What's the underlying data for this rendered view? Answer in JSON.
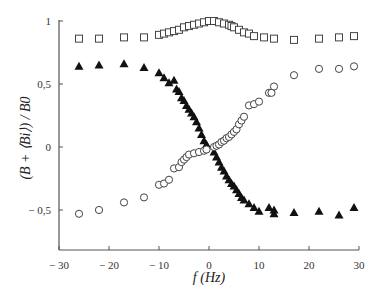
{
  "chart_data": {
    "type": "scatter",
    "title": "",
    "xlabel": "f (Hz)",
    "ylabel": "(B + ⟨Bi⟩) / B0",
    "xlim": [
      -30,
      30
    ],
    "ylim": [
      -0.82,
      1.0
    ],
    "xticks": [
      -30,
      -20,
      -10,
      0,
      10,
      20,
      30
    ],
    "xtick_labels": [
      "− 30",
      "− 20",
      "− 10",
      "0",
      "10",
      "20",
      "30"
    ],
    "yticks": [
      -0.5,
      0,
      0.5,
      1
    ],
    "ytick_labels": [
      "− 0,5",
      "0",
      "0,5",
      "1"
    ],
    "grid": false,
    "legend": null,
    "series": [
      {
        "name": "open squares",
        "marker": "square-open",
        "points": [
          [
            -26,
            0.86
          ],
          [
            -22,
            0.86
          ],
          [
            -17,
            0.87
          ],
          [
            -13,
            0.87
          ],
          [
            -10,
            0.89
          ],
          [
            -9,
            0.9
          ],
          [
            -8,
            0.91
          ],
          [
            -7,
            0.92
          ],
          [
            -6,
            0.93
          ],
          [
            -5,
            0.95
          ],
          [
            -4,
            0.96
          ],
          [
            -3,
            0.97
          ],
          [
            -2,
            0.98
          ],
          [
            -1,
            0.99
          ],
          [
            0,
            1.0
          ],
          [
            1,
            1.0
          ],
          [
            2,
            0.99
          ],
          [
            3,
            0.98
          ],
          [
            4,
            0.97
          ],
          [
            4.5,
            0.96
          ],
          [
            5,
            0.95
          ],
          [
            6,
            0.93
          ],
          [
            7,
            0.91
          ],
          [
            8,
            0.9
          ],
          [
            9,
            0.88
          ],
          [
            11,
            0.87
          ],
          [
            13,
            0.86
          ],
          [
            17,
            0.85
          ],
          [
            22,
            0.86
          ],
          [
            26,
            0.87
          ],
          [
            29,
            0.88
          ]
        ]
      },
      {
        "name": "filled triangles",
        "marker": "triangle-filled",
        "points": [
          [
            -26,
            0.64
          ],
          [
            -22,
            0.65
          ],
          [
            -17,
            0.66
          ],
          [
            -13,
            0.63
          ],
          [
            -10,
            0.59
          ],
          [
            -9,
            0.55
          ],
          [
            -8,
            0.51
          ],
          [
            -7,
            0.53
          ],
          [
            -6.5,
            0.46
          ],
          [
            -6,
            0.44
          ],
          [
            -5.5,
            0.39
          ],
          [
            -5,
            0.37
          ],
          [
            -4.5,
            0.33
          ],
          [
            -4,
            0.3
          ],
          [
            -3.5,
            0.27
          ],
          [
            -3,
            0.24
          ],
          [
            -2.5,
            0.2
          ],
          [
            -2,
            0.15
          ],
          [
            -1.5,
            0.1
          ],
          [
            -1,
            0.05
          ],
          [
            -0.5,
            0.02
          ],
          [
            1,
            -0.04
          ],
          [
            1.5,
            -0.08
          ],
          [
            2,
            -0.12
          ],
          [
            2.5,
            -0.16
          ],
          [
            3,
            -0.19
          ],
          [
            3.5,
            -0.23
          ],
          [
            4,
            -0.26
          ],
          [
            4.5,
            -0.29
          ],
          [
            5,
            -0.31
          ],
          [
            5.5,
            -0.34
          ],
          [
            6,
            -0.37
          ],
          [
            6.5,
            -0.4
          ],
          [
            7,
            -0.42
          ],
          [
            8,
            -0.45
          ],
          [
            9,
            -0.48
          ],
          [
            10,
            -0.51
          ],
          [
            12,
            -0.48
          ],
          [
            13,
            -0.5
          ],
          [
            13,
            -0.53
          ],
          [
            17,
            -0.52
          ],
          [
            22,
            -0.51
          ],
          [
            26,
            -0.54
          ],
          [
            29,
            -0.48
          ]
        ]
      },
      {
        "name": "open circles",
        "marker": "circle-open",
        "points": [
          [
            -26,
            -0.53
          ],
          [
            -22,
            -0.5
          ],
          [
            -17,
            -0.44
          ],
          [
            -13,
            -0.4
          ],
          [
            -10,
            -0.3
          ],
          [
            -9,
            -0.29
          ],
          [
            -8,
            -0.26
          ],
          [
            -7,
            -0.17
          ],
          [
            -6,
            -0.16
          ],
          [
            -5.5,
            -0.12
          ],
          [
            -5,
            -0.1
          ],
          [
            -4.5,
            -0.08
          ],
          [
            -4,
            -0.06
          ],
          [
            -3,
            -0.05
          ],
          [
            -2,
            -0.04
          ],
          [
            -1,
            -0.03
          ],
          [
            -0.5,
            -0.02
          ],
          [
            1,
            0.0
          ],
          [
            1.5,
            0.01
          ],
          [
            2,
            0.02
          ],
          [
            2.5,
            0.04
          ],
          [
            3,
            0.05
          ],
          [
            3.5,
            0.07
          ],
          [
            4,
            0.08
          ],
          [
            4.5,
            0.1
          ],
          [
            5,
            0.12
          ],
          [
            5.5,
            0.14
          ],
          [
            6,
            0.18
          ],
          [
            6.5,
            0.21
          ],
          [
            7,
            0.24
          ],
          [
            8,
            0.33
          ],
          [
            9,
            0.34
          ],
          [
            10,
            0.36
          ],
          [
            12,
            0.43
          ],
          [
            12.5,
            0.43
          ],
          [
            13,
            0.48
          ],
          [
            17,
            0.57
          ],
          [
            22,
            0.62
          ],
          [
            26,
            0.62
          ],
          [
            29,
            0.64
          ]
        ]
      }
    ]
  }
}
